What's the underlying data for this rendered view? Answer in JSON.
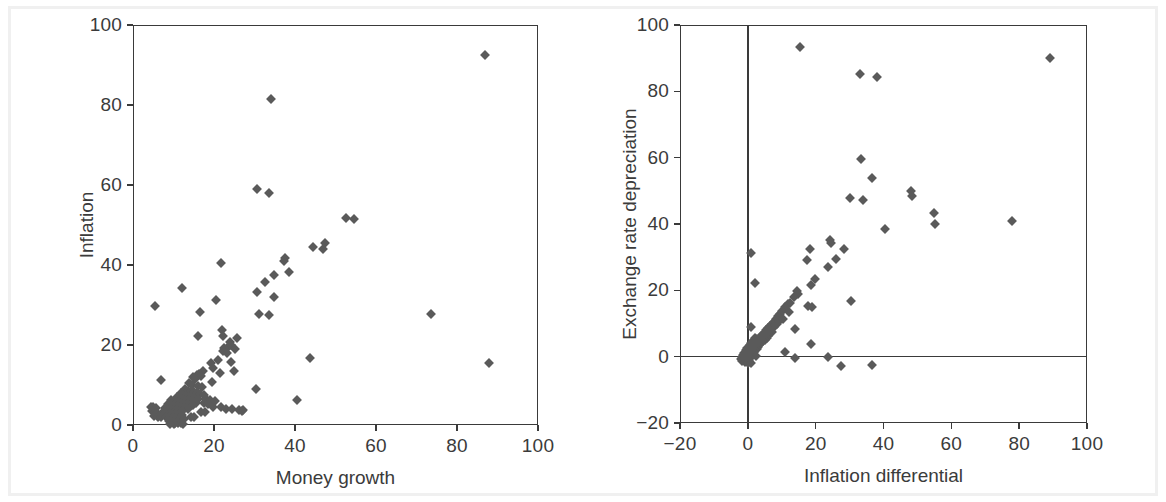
{
  "figure": {
    "background_color": "#ffffff",
    "frame_color": "#f0f0f0",
    "axis_color": "#3a3a3a",
    "marker_color": "#5a5a5a",
    "text_color": "#3b3b3b"
  },
  "chart_data": [
    {
      "type": "scatter",
      "panel": "left",
      "title": "",
      "xlabel": "Money growth",
      "ylabel": "Inflation",
      "xlim": [
        0,
        100
      ],
      "ylim": [
        0,
        100
      ],
      "xticks": [
        0,
        20,
        40,
        60,
        80,
        100
      ],
      "yticks": [
        0,
        20,
        40,
        60,
        80,
        100
      ],
      "xtick_labels": [
        "0",
        "20",
        "40",
        "60",
        "80",
        "100"
      ],
      "ytick_labels": [
        "0",
        "20",
        "40",
        "60",
        "80",
        "100"
      ],
      "grid": false,
      "legend": null,
      "marker": "diamond",
      "points": [
        [
          87.0,
          92.5
        ],
        [
          34.0,
          81.5
        ],
        [
          30.5,
          59.0
        ],
        [
          33.5,
          58.0
        ],
        [
          52.5,
          51.8
        ],
        [
          54.5,
          51.5
        ],
        [
          47.5,
          45.5
        ],
        [
          44.5,
          44.5
        ],
        [
          47.0,
          44.0
        ],
        [
          21.8,
          40.5
        ],
        [
          37.5,
          41.8
        ],
        [
          37.3,
          41.0
        ],
        [
          38.5,
          38.2
        ],
        [
          34.8,
          37.5
        ],
        [
          32.5,
          35.8
        ],
        [
          12.2,
          34.3
        ],
        [
          30.5,
          33.3
        ],
        [
          20.5,
          31.3
        ],
        [
          34.8,
          32.0
        ],
        [
          5.5,
          29.8
        ],
        [
          16.5,
          28.3
        ],
        [
          31.0,
          27.8
        ],
        [
          33.5,
          27.6
        ],
        [
          73.5,
          27.8
        ],
        [
          16.0,
          22.2
        ],
        [
          22.0,
          23.8
        ],
        [
          22.3,
          22.3
        ],
        [
          25.7,
          21.8
        ],
        [
          24.0,
          20.8
        ],
        [
          24.3,
          19.9
        ],
        [
          23.5,
          19.6
        ],
        [
          22.4,
          19.3
        ],
        [
          25.3,
          19.0
        ],
        [
          22.3,
          18.4
        ],
        [
          23.2,
          18.0
        ],
        [
          43.8,
          16.8
        ],
        [
          87.8,
          15.6
        ],
        [
          21.0,
          16.2
        ],
        [
          24.2,
          15.8
        ],
        [
          19.3,
          15.5
        ],
        [
          19.8,
          14.2
        ],
        [
          25.0,
          13.6
        ],
        [
          21.5,
          13.0
        ],
        [
          17.2,
          13.4
        ],
        [
          16.2,
          12.8
        ],
        [
          15.8,
          12.6
        ],
        [
          16.8,
          12.2
        ],
        [
          14.7,
          11.9
        ],
        [
          15.2,
          11.6
        ],
        [
          6.8,
          11.2
        ],
        [
          19.6,
          10.8
        ],
        [
          13.8,
          10.4
        ],
        [
          14.6,
          10.1
        ],
        [
          16.0,
          9.8
        ],
        [
          17.0,
          9.5
        ],
        [
          30.3,
          9.0
        ],
        [
          12.8,
          8.9
        ],
        [
          13.5,
          8.6
        ],
        [
          14.2,
          8.4
        ],
        [
          15.0,
          8.2
        ],
        [
          15.8,
          8.0
        ],
        [
          16.5,
          7.8
        ],
        [
          17.5,
          7.6
        ],
        [
          11.8,
          7.9
        ],
        [
          12.4,
          7.5
        ],
        [
          13.0,
          7.2
        ],
        [
          13.7,
          7.0
        ],
        [
          14.4,
          6.9
        ],
        [
          15.1,
          6.7
        ],
        [
          16.0,
          6.5
        ],
        [
          18.0,
          6.4
        ],
        [
          19.0,
          6.2
        ],
        [
          10.8,
          7.1
        ],
        [
          11.3,
          6.8
        ],
        [
          11.9,
          6.5
        ],
        [
          12.5,
          6.3
        ],
        [
          13.2,
          6.1
        ],
        [
          14.0,
          5.9
        ],
        [
          14.8,
          5.8
        ],
        [
          15.6,
          5.6
        ],
        [
          20.3,
          6.0
        ],
        [
          40.5,
          6.3
        ],
        [
          9.5,
          6.2
        ],
        [
          10.2,
          5.9
        ],
        [
          10.9,
          5.7
        ],
        [
          11.6,
          5.5
        ],
        [
          12.3,
          5.3
        ],
        [
          13.1,
          5.1
        ],
        [
          13.9,
          5.0
        ],
        [
          14.7,
          4.9
        ],
        [
          17.6,
          5.4
        ],
        [
          18.4,
          5.2
        ],
        [
          8.6,
          5.3
        ],
        [
          9.2,
          5.0
        ],
        [
          9.9,
          4.8
        ],
        [
          10.6,
          4.6
        ],
        [
          11.3,
          4.5
        ],
        [
          12.0,
          4.3
        ],
        [
          12.8,
          4.2
        ],
        [
          13.6,
          4.1
        ],
        [
          19.7,
          4.6
        ],
        [
          21.8,
          4.5
        ],
        [
          4.4,
          4.6
        ],
        [
          5.0,
          4.4
        ],
        [
          5.6,
          4.2
        ],
        [
          7.8,
          4.3
        ],
        [
          8.4,
          4.1
        ],
        [
          9.1,
          4.0
        ],
        [
          9.8,
          3.8
        ],
        [
          10.5,
          3.7
        ],
        [
          11.2,
          3.6
        ],
        [
          12.0,
          3.5
        ],
        [
          23.0,
          4.1
        ],
        [
          24.5,
          3.9
        ],
        [
          26.2,
          3.8
        ],
        [
          27.2,
          3.8
        ],
        [
          4.8,
          3.4
        ],
        [
          5.4,
          3.2
        ],
        [
          6.0,
          3.1
        ],
        [
          7.2,
          3.0
        ],
        [
          8.0,
          2.9
        ],
        [
          8.8,
          2.8
        ],
        [
          9.6,
          2.7
        ],
        [
          10.4,
          2.6
        ],
        [
          11.2,
          2.5
        ],
        [
          12.2,
          2.4
        ],
        [
          16.8,
          3.3
        ],
        [
          17.8,
          3.2
        ],
        [
          5.2,
          2.2
        ],
        [
          6.2,
          2.1
        ],
        [
          7.0,
          2.0
        ],
        [
          8.2,
          1.9
        ],
        [
          9.0,
          1.8
        ],
        [
          9.8,
          1.7
        ],
        [
          10.6,
          1.6
        ],
        [
          11.5,
          1.5
        ],
        [
          12.6,
          1.4
        ],
        [
          14.2,
          2.0
        ],
        [
          15.0,
          1.9
        ],
        [
          26.8,
          3.6
        ],
        [
          8.8,
          1.0
        ],
        [
          9.6,
          0.8
        ],
        [
          10.4,
          0.6
        ],
        [
          11.0,
          0.5
        ],
        [
          11.8,
          0.4
        ],
        [
          12.4,
          0.3
        ],
        [
          10.0,
          0.2
        ],
        [
          9.2,
          0.3
        ]
      ]
    },
    {
      "type": "scatter",
      "panel": "right",
      "title": "",
      "xlabel": "Inflation differential",
      "ylabel": "Exchange rate depreciation",
      "xlim": [
        -20,
        100
      ],
      "ylim": [
        -20,
        100
      ],
      "xticks": [
        -20,
        0,
        20,
        40,
        60,
        80,
        100
      ],
      "yticks": [
        -20,
        0,
        20,
        40,
        60,
        80,
        100
      ],
      "xtick_labels": [
        "−20",
        "0",
        "20",
        "40",
        "60",
        "80",
        "100"
      ],
      "ytick_labels": [
        "−20",
        "0",
        "20",
        "40",
        "60",
        "80",
        "100"
      ],
      "grid": false,
      "zero_lines": {
        "x": 0,
        "y": 0
      },
      "legend": null,
      "marker": "diamond",
      "points": [
        [
          15.5,
          93.5
        ],
        [
          89.0,
          90.2
        ],
        [
          33.0,
          85.3
        ],
        [
          38.0,
          84.3
        ],
        [
          33.5,
          59.5
        ],
        [
          36.5,
          53.8
        ],
        [
          48.0,
          49.8
        ],
        [
          48.3,
          48.5
        ],
        [
          30.0,
          47.8
        ],
        [
          34.0,
          47.3
        ],
        [
          55.0,
          43.3
        ],
        [
          78.0,
          41.0
        ],
        [
          55.3,
          40.0
        ],
        [
          40.5,
          38.5
        ],
        [
          24.3,
          35.2
        ],
        [
          24.5,
          34.3
        ],
        [
          1.0,
          31.2
        ],
        [
          18.2,
          32.5
        ],
        [
          28.5,
          32.6
        ],
        [
          26.0,
          29.5
        ],
        [
          17.3,
          29.0
        ],
        [
          23.5,
          27.0
        ],
        [
          19.8,
          23.5
        ],
        [
          2.0,
          22.2
        ],
        [
          18.5,
          21.5
        ],
        [
          14.5,
          19.8
        ],
        [
          14.8,
          18.8
        ],
        [
          13.6,
          18.0
        ],
        [
          30.5,
          16.8
        ],
        [
          12.5,
          16.2
        ],
        [
          11.8,
          15.8
        ],
        [
          17.8,
          15.3
        ],
        [
          19.0,
          15.1
        ],
        [
          11.0,
          15.0
        ],
        [
          10.2,
          13.8
        ],
        [
          9.6,
          13.0
        ],
        [
          9.0,
          12.2
        ],
        [
          8.4,
          11.3
        ],
        [
          7.8,
          10.6
        ],
        [
          8.6,
          10.0
        ],
        [
          7.2,
          9.8
        ],
        [
          1.0,
          8.8
        ],
        [
          6.6,
          9.3
        ],
        [
          7.6,
          8.8
        ],
        [
          13.8,
          8.4
        ],
        [
          6.0,
          8.6
        ],
        [
          6.8,
          8.3
        ],
        [
          5.4,
          8.0
        ],
        [
          6.2,
          7.7
        ],
        [
          7.0,
          7.4
        ],
        [
          5.0,
          7.2
        ],
        [
          5.8,
          7.0
        ],
        [
          4.4,
          6.8
        ],
        [
          5.2,
          6.5
        ],
        [
          6.0,
          6.3
        ],
        [
          4.0,
          6.1
        ],
        [
          4.8,
          5.9
        ],
        [
          5.6,
          5.7
        ],
        [
          3.5,
          5.5
        ],
        [
          4.3,
          5.3
        ],
        [
          5.1,
          5.1
        ],
        [
          2.0,
          5.6
        ],
        [
          2.8,
          5.2
        ],
        [
          3.6,
          4.9
        ],
        [
          4.4,
          4.7
        ],
        [
          18.5,
          3.7
        ],
        [
          1.5,
          4.8
        ],
        [
          2.3,
          4.5
        ],
        [
          3.1,
          4.3
        ],
        [
          3.9,
          4.1
        ],
        [
          1.0,
          4.2
        ],
        [
          1.8,
          4.0
        ],
        [
          2.6,
          3.8
        ],
        [
          3.4,
          3.6
        ],
        [
          0.5,
          3.6
        ],
        [
          1.3,
          3.4
        ],
        [
          2.1,
          3.2
        ],
        [
          2.9,
          3.0
        ],
        [
          0.2,
          3.0
        ],
        [
          1.0,
          2.8
        ],
        [
          1.8,
          2.6
        ],
        [
          2.6,
          2.4
        ],
        [
          -0.3,
          2.5
        ],
        [
          0.5,
          2.3
        ],
        [
          1.3,
          2.1
        ],
        [
          2.1,
          1.9
        ],
        [
          11.0,
          1.5
        ],
        [
          -0.6,
          1.9
        ],
        [
          0.2,
          1.7
        ],
        [
          1.0,
          1.5
        ],
        [
          1.8,
          1.3
        ],
        [
          -1.0,
          1.2
        ],
        [
          -0.2,
          1.0
        ],
        [
          0.6,
          0.8
        ],
        [
          1.4,
          0.7
        ],
        [
          -1.4,
          0.5
        ],
        [
          -0.6,
          0.4
        ],
        [
          0.2,
          0.3
        ],
        [
          1.0,
          0.2
        ],
        [
          2.4,
          0.1
        ],
        [
          -1.8,
          0.0
        ],
        [
          -1.0,
          -0.1
        ],
        [
          -0.2,
          -0.2
        ],
        [
          0.6,
          -0.3
        ],
        [
          14.0,
          -0.5
        ],
        [
          23.5,
          -0.2
        ],
        [
          -2.0,
          -0.6
        ],
        [
          -1.2,
          -0.8
        ],
        [
          -0.4,
          -1.0
        ],
        [
          0.4,
          -1.1
        ],
        [
          -1.6,
          -1.4
        ],
        [
          -0.8,
          -1.6
        ],
        [
          0.0,
          -1.8
        ],
        [
          0.8,
          -1.9
        ],
        [
          27.5,
          -2.8
        ],
        [
          36.5,
          -2.5
        ],
        [
          8.0,
          9.6
        ],
        [
          9.2,
          10.8
        ],
        [
          10.4,
          11.5
        ],
        [
          12.0,
          13.4
        ]
      ]
    }
  ]
}
